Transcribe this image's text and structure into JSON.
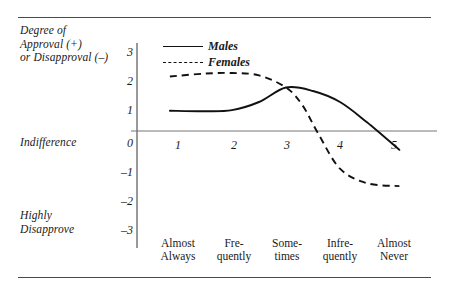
{
  "figure": {
    "rule_top": "",
    "rule_bottom": ""
  },
  "chart_data": {
    "type": "line",
    "title": "",
    "ylabel": "Degree of\nApproval (+)\nor Disapproval (–)",
    "xlabel": "",
    "categories": [
      "Almost\nAlways",
      "Fre-\nquently",
      "Some-\ntimes",
      "Infre-\nquently",
      "Almost\nNever"
    ],
    "x": [
      1,
      2,
      3,
      4,
      5
    ],
    "xtick_labels": [
      "1",
      "2",
      "3",
      "4",
      "5"
    ],
    "ytick_labels": [
      "3",
      "2",
      "1",
      "0",
      "–1",
      "–2",
      "–3"
    ],
    "ytick_values": [
      3,
      2,
      1,
      0,
      -1,
      -2,
      -3
    ],
    "ylim": [
      -3,
      3
    ],
    "xlim": [
      0.7,
      5.3
    ],
    "grid": false,
    "zero_line": true,
    "legend_position": "top-left",
    "axis_annotations": [
      {
        "value": 0,
        "label": "Indifference"
      },
      {
        "value": -3,
        "label": "Highly\nDisapprove"
      }
    ],
    "series": [
      {
        "name": "Males",
        "style": "solid",
        "color": "#111111",
        "values": [
          0.7,
          0.72,
          1.5,
          1.0,
          -0.65
        ],
        "points": [
          {
            "x": 0.85,
            "y": 0.7
          },
          {
            "x": 1.5,
            "y": 0.68
          },
          {
            "x": 2.0,
            "y": 0.72
          },
          {
            "x": 2.5,
            "y": 1.0
          },
          {
            "x": 3.0,
            "y": 1.5
          },
          {
            "x": 3.5,
            "y": 1.38
          },
          {
            "x": 4.0,
            "y": 1.0
          },
          {
            "x": 4.5,
            "y": 0.3
          },
          {
            "x": 5.1,
            "y": -0.65
          }
        ]
      },
      {
        "name": "Females",
        "style": "dashed",
        "color": "#111111",
        "values": [
          1.88,
          2.0,
          1.5,
          -1.3,
          -1.9
        ],
        "points": [
          {
            "x": 0.85,
            "y": 1.88
          },
          {
            "x": 1.5,
            "y": 1.98
          },
          {
            "x": 2.0,
            "y": 2.0
          },
          {
            "x": 2.5,
            "y": 1.92
          },
          {
            "x": 3.0,
            "y": 1.5
          },
          {
            "x": 3.3,
            "y": 0.9
          },
          {
            "x": 3.6,
            "y": -0.1
          },
          {
            "x": 4.0,
            "y": -1.3
          },
          {
            "x": 4.5,
            "y": -1.8
          },
          {
            "x": 5.1,
            "y": -1.9
          }
        ]
      }
    ],
    "legend": [
      {
        "label": "Males",
        "style": "solid"
      },
      {
        "label": "Females",
        "style": "dashed"
      }
    ]
  }
}
